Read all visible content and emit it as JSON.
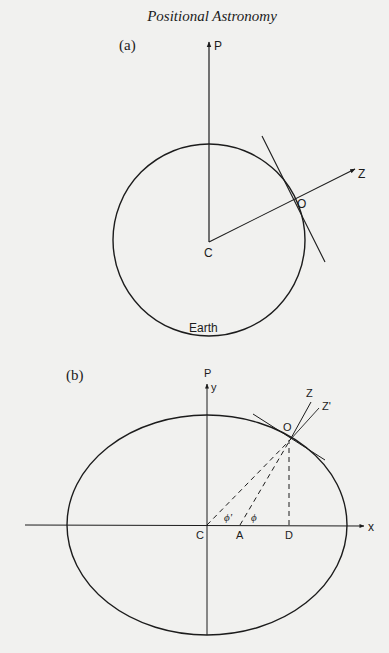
{
  "page": {
    "running_head": "Positional Astronomy",
    "background": "#f1f1ef",
    "ink": "#1c1c1c"
  },
  "figure_a": {
    "panel_label": "(a)",
    "labels": {
      "pole": "P",
      "zenith": "Z",
      "observer": "O",
      "center": "C",
      "body": "Earth"
    },
    "description": "Spherical Earth: radius CO extended to zenith Z, tangent at O, polar axis CP"
  },
  "figure_b": {
    "panel_label": "(b)",
    "labels": {
      "pole": "P",
      "y_axis": "y",
      "x_axis": "x",
      "geocentric_zenith": "Z'",
      "geodetic_zenith": "Z",
      "observer": "O",
      "center": "C",
      "normal_foot": "A",
      "perpendicular_foot": "D",
      "geocentric_latitude": "ϕ'",
      "geodetic_latitude": "ϕ"
    },
    "description": "Ellipsoidal Earth cross-section with geocentric and geodetic latitude"
  }
}
